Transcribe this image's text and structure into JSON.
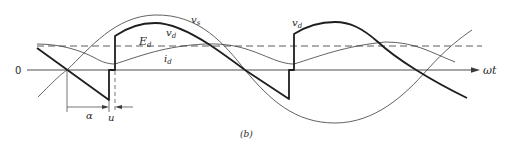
{
  "figure": {
    "caption": "(b)",
    "axis": {
      "origin_label": "0",
      "x_label": "ωt"
    },
    "labels": {
      "vs": {
        "main": "v",
        "sub": "s"
      },
      "vd_first": {
        "main": "v",
        "sub": "d"
      },
      "vd_second": {
        "main": "v",
        "sub": "d"
      },
      "Ed": {
        "main": "E",
        "sub": "d"
      },
      "id": {
        "main": "i",
        "sub": "d"
      },
      "alpha": "α",
      "u": "u"
    },
    "colors": {
      "line": "#2a2a2a",
      "background": "#ffffff"
    }
  }
}
